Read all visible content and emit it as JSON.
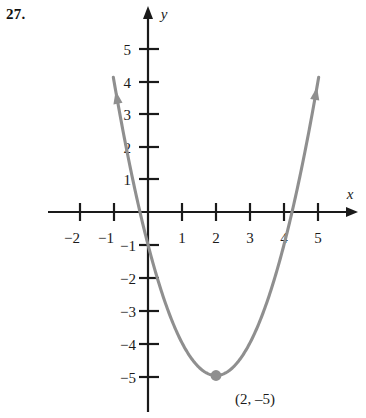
{
  "problem": {
    "number": "27."
  },
  "chart_data": {
    "type": "line",
    "title": "",
    "subtitle": "",
    "xlabel": "x",
    "ylabel": "y",
    "grid": false,
    "legend": "none",
    "xlim": [
      -2.7,
      5.9
    ],
    "ylim": [
      -6.0,
      6.3
    ],
    "x_ticks": [
      -2,
      -1,
      1,
      2,
      3,
      4,
      5
    ],
    "x_tick_labels": [
      "−2",
      "−1",
      "1",
      "2",
      "3",
      "4",
      "5"
    ],
    "y_ticks": [
      5,
      4,
      3,
      2,
      1,
      -1,
      -2,
      -3,
      -4,
      -5
    ],
    "y_tick_labels": [
      "5",
      "4",
      "3",
      "2",
      "1",
      "−1",
      "−2",
      "−3",
      "−4",
      "−5"
    ],
    "curve": {
      "name": "parabola",
      "equation": "y = (x - 2)^2 - 5",
      "color": "#8f8f8f",
      "vertex": [
        2,
        -5
      ],
      "x_intercepts": [
        -0.236,
        4.236
      ],
      "y_intercept": -1,
      "x": [
        -0.9,
        -0.7,
        -0.5,
        -0.3,
        -0.1,
        0.1,
        0.3,
        0.5,
        0.7,
        0.9,
        1.1,
        1.3,
        1.5,
        1.7,
        1.9,
        2.1,
        2.3,
        2.5,
        2.7,
        2.9,
        3.1,
        3.3,
        3.5,
        3.7,
        3.9,
        4.1,
        4.3,
        4.5,
        4.7,
        4.9
      ],
      "y": [
        3.41,
        2.29,
        1.25,
        0.29,
        -0.59,
        -1.39,
        -2.11,
        -2.75,
        -3.31,
        -3.79,
        -4.19,
        -4.51,
        -4.75,
        -4.91,
        -4.99,
        -4.99,
        -4.91,
        -4.75,
        -4.51,
        -4.19,
        -3.79,
        -3.31,
        -2.75,
        -2.11,
        -1.39,
        -0.59,
        0.29,
        1.25,
        2.29,
        3.41
      ],
      "arrow_ends": [
        "upper-left",
        "upper-right"
      ]
    },
    "annotations": [
      {
        "name": "vertex-point",
        "marker": "filled-circle",
        "color": "#8f8f8f",
        "at": [
          2,
          -5
        ],
        "label": "(2, –5)"
      }
    ]
  }
}
